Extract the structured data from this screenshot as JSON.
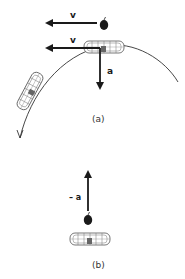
{
  "diagram": {
    "panel_a": {
      "caption": "(a)",
      "apple_velocity_label": "v",
      "car_velocity_label": "v",
      "car_acceleration_label": "a",
      "elements": [
        "apple",
        "car-top-of-arc",
        "car-descending",
        "curved-path"
      ]
    },
    "panel_b": {
      "caption": "(b)",
      "apple_relative_acceleration_label": "– a",
      "elements": [
        "apple",
        "car"
      ]
    },
    "colors": {
      "ink": "#1a1a1a",
      "background": "#ffffff",
      "car_outline": "#555555"
    }
  }
}
